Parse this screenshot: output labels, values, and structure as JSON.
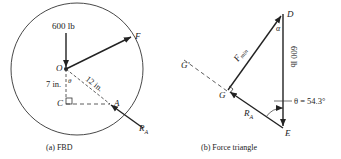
{
  "fbd": {
    "caption": "(a) FBD",
    "load_label": "600 lb",
    "force_label": "F",
    "point_o": "O",
    "point_c": "C",
    "point_a": "A",
    "theta": "θ",
    "dim_7": "7 in.",
    "dim_12": "12 in.",
    "reaction_label": "R",
    "reaction_sub": "A"
  },
  "triangle": {
    "caption": "(b) Force triangle",
    "point_d": "D",
    "point_e": "E",
    "point_g": "G",
    "point_g_prime": "G'",
    "alpha": "α",
    "fmin_label": "F",
    "fmin_sub": "min",
    "load_label": "600 lb",
    "reaction_label": "R",
    "reaction_sub": "A",
    "theta_label": "θ = 54.3°"
  }
}
